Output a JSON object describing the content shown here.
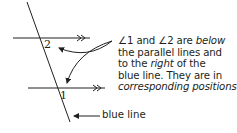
{
  "diagram": {
    "type": "parallel-lines-transversal",
    "angle_labels": [
      {
        "id": "angle-1",
        "text": "1"
      },
      {
        "id": "angle-2",
        "text": "2"
      }
    ],
    "explanation": {
      "line1_pre": "∠1 and ∠2 are ",
      "line1_em": "below",
      "line2": "the parallel lines and",
      "line3_pre": "to the ",
      "line3_em": "right",
      "line3_post": " of the",
      "line4": "blue line. They are in",
      "line5_em": "corresponding positions",
      "line5_post": "."
    },
    "transversal_label": "blue line",
    "parallel_marker": "»",
    "colors": {
      "line": "#231f20",
      "text": "#231f20",
      "background": "#ffffff"
    }
  }
}
